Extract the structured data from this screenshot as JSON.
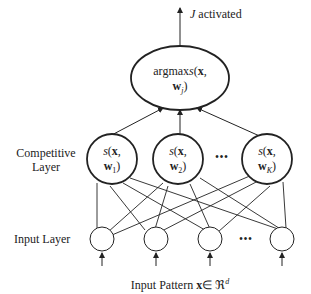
{
  "diagram": {
    "output_label_var": "J",
    "output_label_text": " activated",
    "argmax_line1": "argmax",
    "argmax_s": "s",
    "argmax_x": "x",
    "argmax_w": "w",
    "argmax_sub": "j",
    "competitive_label": "Competitive Layer",
    "input_layer_label": "Input Layer",
    "input_pattern_text": "Input Pattern ",
    "input_pattern_x": "x",
    "input_pattern_in": "∈ ℜ",
    "input_pattern_sup": "d",
    "competitive_nodes": [
      {
        "s": "s",
        "x": "x",
        "w": "w",
        "sub": "1"
      },
      {
        "s": "s",
        "x": "x",
        "w": "w",
        "sub": "2"
      },
      {
        "s": "s",
        "x": "x",
        "w": "w",
        "sub": "K"
      }
    ],
    "ellipsis": "•••"
  }
}
